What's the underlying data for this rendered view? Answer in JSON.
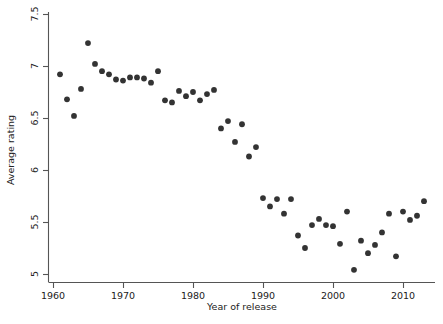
{
  "chart_data": {
    "type": "scatter",
    "title": "",
    "xlabel": "Year of release",
    "ylabel": "Average rating",
    "xlim": [
      1959,
      2014.5
    ],
    "ylim": [
      4.9,
      7.55
    ],
    "xticks": [
      1960,
      1970,
      1980,
      1990,
      2000,
      2010
    ],
    "xtick_labels": [
      "1960",
      "1970",
      "1980",
      "1990",
      "2000",
      "2010"
    ],
    "yticks": [
      5,
      5.5,
      6,
      6.5,
      7,
      7.5
    ],
    "ytick_labels": [
      "5",
      "5.5",
      "6",
      "6.5",
      "7",
      "7.5"
    ],
    "grid": false,
    "legend": null,
    "marker": "filled-circle",
    "marker_color": "#333333",
    "x": [
      1961,
      1962,
      1963,
      1964,
      1965,
      1966,
      1967,
      1968,
      1969,
      1970,
      1971,
      1972,
      1973,
      1974,
      1975,
      1976,
      1977,
      1978,
      1979,
      1980,
      1981,
      1982,
      1983,
      1984,
      1985,
      1986,
      1987,
      1988,
      1989,
      1990,
      1991,
      1992,
      1993,
      1994,
      1995,
      1996,
      1997,
      1998,
      1999,
      2000,
      2001,
      2002,
      2003,
      2004,
      2005,
      2006,
      2007,
      2008,
      2009,
      2010,
      2011,
      2012,
      2013
    ],
    "y": [
      6.92,
      6.68,
      6.52,
      6.78,
      7.22,
      7.02,
      6.95,
      6.92,
      6.87,
      6.86,
      6.89,
      6.89,
      6.88,
      6.84,
      6.95,
      6.67,
      6.65,
      6.76,
      6.71,
      6.75,
      6.67,
      6.73,
      6.77,
      6.4,
      6.47,
      6.27,
      6.44,
      6.13,
      6.22,
      5.73,
      5.65,
      5.72,
      5.58,
      5.72,
      5.37,
      5.25,
      5.47,
      5.53,
      5.47,
      5.46,
      5.29,
      5.6,
      5.04,
      5.32,
      5.2,
      5.28,
      5.4,
      5.58,
      5.17,
      5.6,
      5.52,
      5.56,
      5.7,
      5.86
    ]
  },
  "axes": {
    "x_axis_title": "Year of release",
    "y_axis_title": "Average rating"
  }
}
